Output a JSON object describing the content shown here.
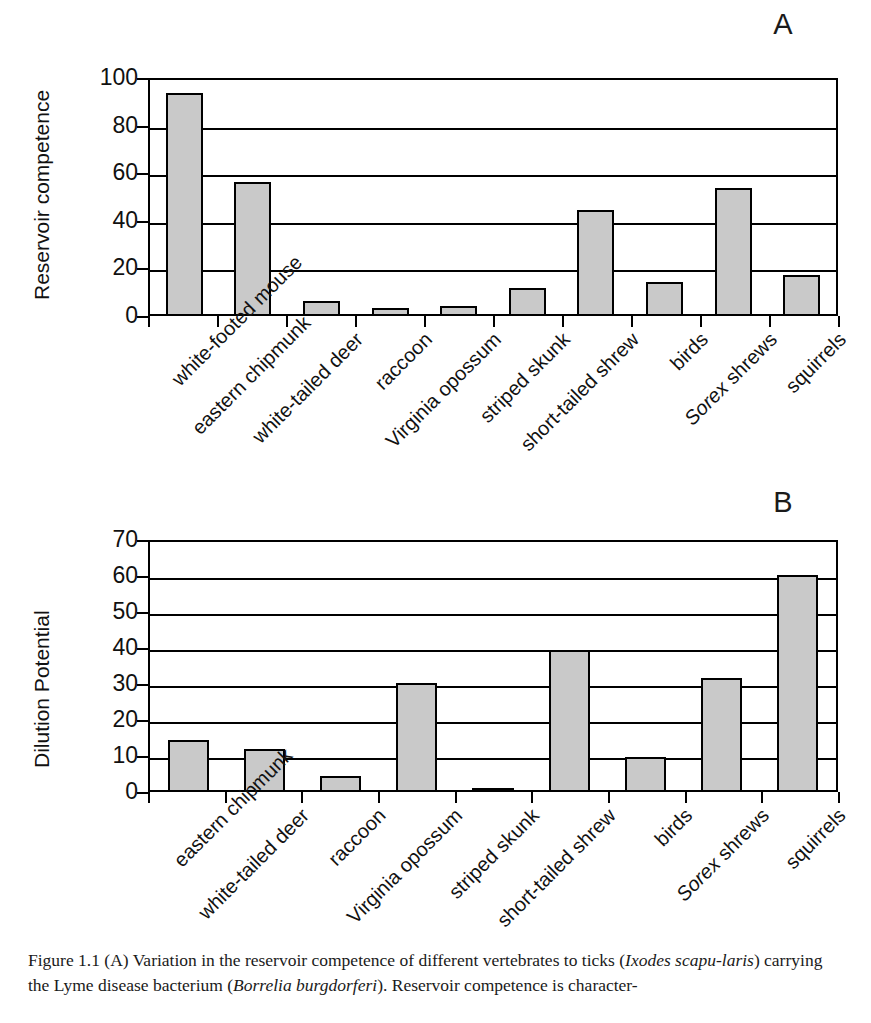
{
  "figure": {
    "caption_line1": "Figure 1.1  (A) Variation in the reservoir competence of different vertebrates to ticks (",
    "caption_sci1": "Ixodes scapu-",
    "caption_sci1b": "laris",
    "caption_line2": ") carrying the Lyme disease bacterium (",
    "caption_sci2": "Borrelia burgdorferi",
    "caption_line3": "). Reservoir competence is character-",
    "colors": {
      "bar_fill": "#c9c9c9",
      "bar_stroke": "#000000",
      "axis": "#000000",
      "text": "#111111",
      "background": "#ffffff"
    }
  },
  "panel_a": {
    "letter": "A",
    "ylabel": "Reservoir competence"
  },
  "panel_b": {
    "letter": "B",
    "ylabel": "Dilution Potential"
  },
  "chart_data": [
    {
      "type": "bar",
      "panel": "A",
      "title": "",
      "xlabel": "",
      "ylabel": "Reservoir competence",
      "ylim": [
        0,
        100
      ],
      "yticks": [
        0,
        20,
        40,
        60,
        80,
        100
      ],
      "grid": true,
      "legend": "none",
      "categories": [
        "white-footed mouse",
        "eastern chipmunk",
        "white-tailed deer",
        "raccoon",
        "Virginia opossum",
        "striped skunk",
        "short-tailed shrew",
        "birds",
        "Sorex shrews",
        "squirrels"
      ],
      "categories_italic_prefix": {
        "8": "Sorex"
      },
      "values": [
        93,
        55.5,
        5.5,
        2.5,
        3.5,
        11,
        43.5,
        13.5,
        53,
        16.5
      ]
    },
    {
      "type": "bar",
      "panel": "B",
      "title": "",
      "xlabel": "",
      "ylabel": "Dilution Potential",
      "ylim": [
        0,
        70
      ],
      "yticks": [
        0,
        10,
        20,
        30,
        40,
        50,
        60,
        70
      ],
      "grid": true,
      "legend": "none",
      "categories": [
        "eastern chipmunk",
        "white-tailed deer",
        "raccoon",
        "Virginia opossum",
        "striped skunk",
        "short-tailed shrew",
        "birds",
        "Sorex shrews",
        "squirrels"
      ],
      "categories_italic_prefix": {
        "7": "Sorex"
      },
      "values": [
        14,
        11.5,
        3.8,
        29.8,
        0.6,
        39,
        9.2,
        31.2,
        59.8
      ]
    }
  ]
}
